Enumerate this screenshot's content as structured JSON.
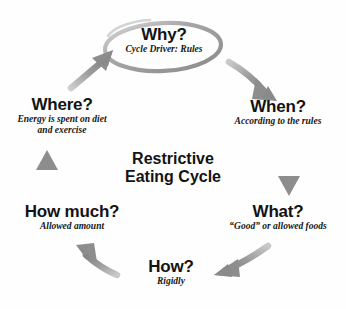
{
  "diagram": {
    "center_title_line1": "Restrictive",
    "center_title_line2": "Eating Cycle",
    "background_color": "#fefefe",
    "arrow_color": "#8d8d8d",
    "text_color": "#131313"
  },
  "nodes": [
    {
      "id": "why",
      "title": "Why?",
      "caption": "Cycle Driver: Rules",
      "highlighted": true,
      "highlight_shape": "ellipse"
    },
    {
      "id": "when",
      "title": "When?",
      "caption": "According to the rules",
      "highlighted": false
    },
    {
      "id": "what",
      "title": "What?",
      "caption": "“Good” or allowed foods",
      "highlighted": false
    },
    {
      "id": "how",
      "title": "How?",
      "caption": "Rigidly",
      "highlighted": false
    },
    {
      "id": "how-much",
      "title": "How much?",
      "caption": "Allowed amount",
      "highlighted": false
    },
    {
      "id": "where",
      "title": "Where?",
      "caption_line1": "Energy is spent on diet",
      "caption_line2": "and exercise",
      "highlighted": false
    }
  ],
  "arrows": [
    {
      "id": "why-to-when",
      "from": "why",
      "to": "when",
      "direction": "down-right"
    },
    {
      "id": "when-to-what",
      "from": "when",
      "to": "what",
      "direction": "down"
    },
    {
      "id": "what-to-how",
      "from": "what",
      "to": "how",
      "direction": "down-left"
    },
    {
      "id": "how-to-how-much",
      "from": "how",
      "to": "how-much",
      "direction": "up-left"
    },
    {
      "id": "how-much-to-where",
      "from": "how-much",
      "to": "where",
      "direction": "up"
    },
    {
      "id": "where-to-why",
      "from": "where",
      "to": "why",
      "direction": "up-right"
    }
  ]
}
